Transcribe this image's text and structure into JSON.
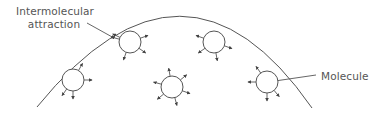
{
  "diagram": {
    "labels": {
      "attraction_line1": "Intermolecular",
      "attraction_line2": "attraction",
      "molecule": "Molecule"
    },
    "colors": {
      "stroke": "#555555",
      "text": "#555555",
      "background": "#ffffff"
    },
    "surface_arc": {
      "start": [
        37,
        107
      ],
      "control": [
        185,
        -75
      ],
      "end": [
        312,
        108
      ]
    },
    "molecules": [
      {
        "id": "m1",
        "cx": 130,
        "cy": 42,
        "r": 11,
        "arrows": [
          [
            -155,
            "out"
          ],
          [
            -165,
            "out2"
          ],
          [
            -20,
            "out"
          ],
          [
            35,
            "out"
          ],
          [
            110,
            "out"
          ]
        ]
      },
      {
        "id": "m2",
        "cx": 214,
        "cy": 42,
        "r": 11,
        "arrows": [
          [
            -160,
            "out"
          ],
          [
            20,
            "out"
          ],
          [
            145,
            "out"
          ],
          [
            80,
            "out"
          ]
        ]
      },
      {
        "id": "m3",
        "cx": 73,
        "cy": 80,
        "r": 11,
        "arrows": [
          [
            -60,
            "out"
          ],
          [
            0,
            "out"
          ],
          [
            125,
            "out"
          ],
          [
            90,
            "out"
          ]
        ]
      },
      {
        "id": "m4",
        "cx": 172,
        "cy": 87,
        "r": 11,
        "arrows": [
          [
            -100,
            "out"
          ],
          [
            -40,
            "out"
          ],
          [
            -165,
            "out"
          ],
          [
            20,
            "out"
          ],
          [
            75,
            "out"
          ],
          [
            140,
            "out"
          ]
        ]
      },
      {
        "id": "m5",
        "cx": 267,
        "cy": 82,
        "r": 11,
        "arrows": [
          [
            -125,
            "out"
          ],
          [
            180,
            "out"
          ],
          [
            90,
            "out"
          ],
          [
            50,
            "out"
          ]
        ]
      }
    ]
  }
}
